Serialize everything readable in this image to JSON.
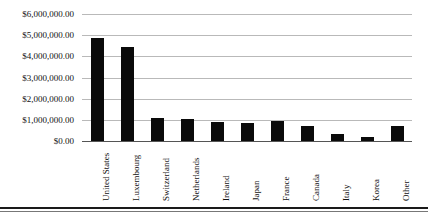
{
  "chart_data": {
    "type": "bar",
    "title": "",
    "subtitle": "",
    "xlabel": "",
    "ylabel": "",
    "ylim": [
      0,
      6000000
    ],
    "grid": true,
    "legend": "none",
    "orientation": "vertical",
    "bar_color": "#0a0a0a",
    "gridline_color": "#b9b9b9",
    "categories": [
      "United States",
      "Luxembourg",
      "Switzerland",
      "Netherlands",
      "Ireland",
      "Japan",
      "France",
      "Canada",
      "Italy",
      "Korea",
      "Other"
    ],
    "values": [
      4850000,
      4420000,
      1090000,
      1040000,
      880000,
      870000,
      930000,
      700000,
      350000,
      200000,
      700000
    ],
    "ytick_values": [
      0,
      1000000,
      2000000,
      3000000,
      4000000,
      5000000,
      6000000
    ],
    "ytick_labels": [
      "$0.00",
      "$1,000,000.00",
      "$2,000,000.00",
      "$3,000,000.00",
      "$4,000,000.00",
      "$5,000,000.00",
      "$6,000,000.00"
    ]
  }
}
